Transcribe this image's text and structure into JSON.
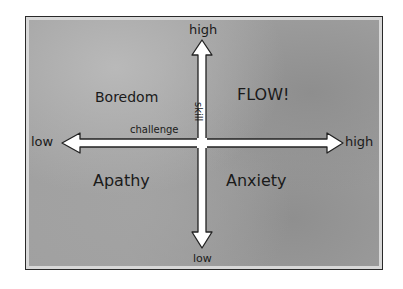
{
  "diagram": {
    "x_axis": {
      "name": "challenge",
      "low_label": "low",
      "high_label": "high"
    },
    "y_axis": {
      "name": "skill",
      "low_label": "low",
      "high_label": "high"
    },
    "quadrants": {
      "top_left": "Boredom",
      "top_right": "FLOW!",
      "bottom_left": "Apathy",
      "bottom_right": "Anxiety"
    },
    "colors": {
      "background": "#a0a0a0",
      "arrow_fill": "#ffffff",
      "ink": "#1a1a1a"
    }
  }
}
